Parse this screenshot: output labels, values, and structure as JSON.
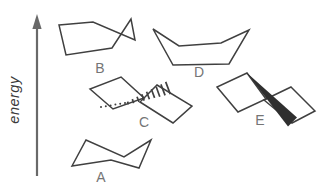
{
  "figure": {
    "axis_label": "energy",
    "conformations": [
      {
        "label": "A",
        "shape": "chair"
      },
      {
        "label": "B",
        "shape": "half-chair"
      },
      {
        "label": "C",
        "shape": "twist-boat-hashed-bond"
      },
      {
        "label": "D",
        "shape": "boat"
      },
      {
        "label": "E",
        "shape": "twist-boat-solid-wedge-bond"
      }
    ],
    "colors": {
      "line": "#404040",
      "label": "#757575",
      "arrow": "#696969",
      "background": "#ffffff"
    }
  }
}
